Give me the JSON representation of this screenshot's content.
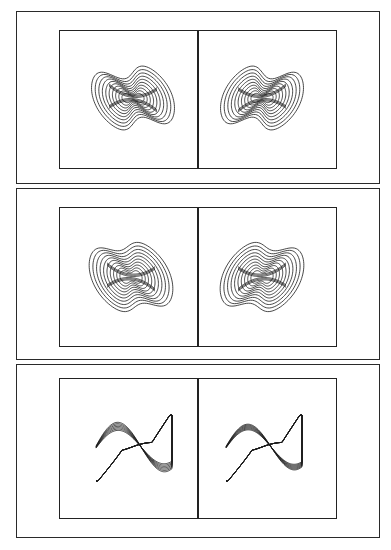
{
  "figure": {
    "panels": [
      {
        "id": "top",
        "outer": {
          "x": 16,
          "y": 11,
          "w": 364,
          "h": 173
        },
        "inner": {
          "x": 59,
          "y": 30,
          "w": 278,
          "h": 139
        },
        "kind": "bowtie",
        "variant": "tight",
        "plots": [
          {
            "cx": 133,
            "cy": 98,
            "mirror": false
          },
          {
            "cx": 262,
            "cy": 98,
            "mirror": true
          }
        ]
      },
      {
        "id": "middle",
        "outer": {
          "x": 16,
          "y": 188,
          "w": 364,
          "h": 172
        },
        "inner": {
          "x": 59,
          "y": 207,
          "w": 278,
          "h": 140
        },
        "kind": "bowtie",
        "variant": "wide",
        "plots": [
          {
            "cx": 131,
            "cy": 277,
            "mirror": false
          },
          {
            "cx": 262,
            "cy": 277,
            "mirror": true
          }
        ]
      },
      {
        "id": "bottom",
        "outer": {
          "x": 16,
          "y": 364,
          "w": 364,
          "h": 174
        },
        "inner": {
          "x": 59,
          "y": 378,
          "w": 278,
          "h": 141
        },
        "kind": "sshape",
        "plots": [
          {
            "cx": 132,
            "cy": 449,
            "spread": 1.0
          },
          {
            "cx": 262,
            "cy": 449,
            "spread": 0.7
          }
        ]
      }
    ],
    "stroke_color": "#1a1a1a"
  }
}
